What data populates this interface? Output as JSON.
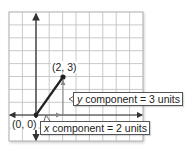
{
  "diagram": {
    "type": "coordinate-grid-vector",
    "grid": {
      "columns": 10,
      "rows": 10,
      "origin_col": 2,
      "origin_row_from_top": 8
    },
    "colors": {
      "grid": "#bdbdbd",
      "axis": "#333333",
      "vector": "#222222",
      "component_arrow": "#888888",
      "background": "#ffffff"
    },
    "points": [
      {
        "id": "origin",
        "label": "(0, 0)",
        "x": 0,
        "y": 0
      },
      {
        "id": "tip",
        "label": "(2, 3)",
        "x": 2,
        "y": 3
      }
    ],
    "callouts": {
      "y_component": {
        "var": "y",
        "text": " component = 3 units"
      },
      "x_component": {
        "var": "x",
        "text": " component = 2 units"
      }
    }
  }
}
